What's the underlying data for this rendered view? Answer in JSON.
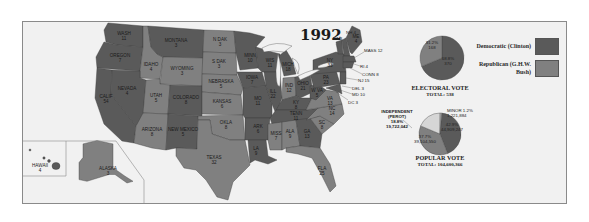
{
  "title": "1992",
  "colors": {
    "democratic": "#5a5a5a",
    "republican": "#808080",
    "independent": "#d6d6d6",
    "minor": "#b0b0b0",
    "water": "#f1f1f1",
    "border": "#3a3a3a"
  },
  "legend": [
    {
      "label": "Democratic (Clinton)",
      "party": "democratic"
    },
    {
      "label": "Republican (G.H.W. Bush)",
      "party": "republican"
    }
  ],
  "states": [
    {
      "abbr": "WASH",
      "ev": "11",
      "party": "democratic"
    },
    {
      "abbr": "OREGON",
      "ev": "7",
      "party": "democratic"
    },
    {
      "abbr": "CALIF",
      "ev": "54",
      "party": "democratic"
    },
    {
      "abbr": "IDAHO",
      "ev": "4",
      "party": "republican"
    },
    {
      "abbr": "NEVADA",
      "ev": "4",
      "party": "democratic"
    },
    {
      "abbr": "MONTANA",
      "ev": "3",
      "party": "democratic"
    },
    {
      "abbr": "WYOMING",
      "ev": "3",
      "party": "republican"
    },
    {
      "abbr": "UTAH",
      "ev": "5",
      "party": "republican"
    },
    {
      "abbr": "COLORADO",
      "ev": "8",
      "party": "democratic"
    },
    {
      "abbr": "ARIZONA",
      "ev": "8",
      "party": "republican"
    },
    {
      "abbr": "NEW MEXICO",
      "ev": "5",
      "party": "democratic"
    },
    {
      "abbr": "N DAK",
      "ev": "3",
      "party": "republican"
    },
    {
      "abbr": "S DAK",
      "ev": "3",
      "party": "republican"
    },
    {
      "abbr": "NEBRASKA",
      "ev": "5",
      "party": "republican"
    },
    {
      "abbr": "KANSAS",
      "ev": "6",
      "party": "republican"
    },
    {
      "abbr": "OKLA",
      "ev": "8",
      "party": "republican"
    },
    {
      "abbr": "TEXAS",
      "ev": "32",
      "party": "republican"
    },
    {
      "abbr": "MINN",
      "ev": "10",
      "party": "democratic"
    },
    {
      "abbr": "IOWA",
      "ev": "7",
      "party": "democratic"
    },
    {
      "abbr": "MO",
      "ev": "11",
      "party": "democratic"
    },
    {
      "abbr": "ARK",
      "ev": "6",
      "party": "democratic"
    },
    {
      "abbr": "LA",
      "ev": "9",
      "party": "democratic"
    },
    {
      "abbr": "WIS",
      "ev": "11",
      "party": "democratic"
    },
    {
      "abbr": "ILL",
      "ev": "22",
      "party": "democratic"
    },
    {
      "abbr": "MICH",
      "ev": "18",
      "party": "democratic"
    },
    {
      "abbr": "IND",
      "ev": "12",
      "party": "republican"
    },
    {
      "abbr": "OHIO",
      "ev": "21",
      "party": "democratic"
    },
    {
      "abbr": "KY",
      "ev": "8",
      "party": "democratic"
    },
    {
      "abbr": "TENN",
      "ev": "11",
      "party": "democratic"
    },
    {
      "abbr": "MISS",
      "ev": "7",
      "party": "republican"
    },
    {
      "abbr": "ALA",
      "ev": "9",
      "party": "republican"
    },
    {
      "abbr": "GA",
      "ev": "13",
      "party": "democratic"
    },
    {
      "abbr": "FLA",
      "ev": "25",
      "party": "republican"
    },
    {
      "abbr": "SC",
      "ev": "8",
      "party": "republican"
    },
    {
      "abbr": "NC",
      "ev": "14",
      "party": "republican"
    },
    {
      "abbr": "VA",
      "ev": "13",
      "party": "republican"
    },
    {
      "abbr": "W VA",
      "ev": "5",
      "party": "democratic"
    },
    {
      "abbr": "PA",
      "ev": "23",
      "party": "democratic"
    },
    {
      "abbr": "NY",
      "ev": "33",
      "party": "democratic"
    },
    {
      "abbr": "VT",
      "ev": "3",
      "party": "democratic"
    },
    {
      "abbr": "NH",
      "ev": "4",
      "party": "democratic"
    },
    {
      "abbr": "ME",
      "ev": "4",
      "party": "democratic"
    },
    {
      "abbr": "MASS",
      "ev": "12",
      "party": "democratic"
    },
    {
      "abbr": "RI",
      "ev": "4",
      "party": "democratic"
    },
    {
      "abbr": "CONN",
      "ev": "8",
      "party": "democratic"
    },
    {
      "abbr": "NJ",
      "ev": "15",
      "party": "democratic"
    },
    {
      "abbr": "DEL",
      "ev": "3",
      "party": "democratic"
    },
    {
      "abbr": "MD",
      "ev": "10",
      "party": "democratic"
    },
    {
      "abbr": "DC",
      "ev": "3",
      "party": "democratic"
    },
    {
      "abbr": "HAWAII",
      "ev": "4",
      "party": "democratic"
    },
    {
      "abbr": "ALASKA",
      "ev": "3",
      "party": "republican"
    }
  ],
  "callouts": {
    "vt": "VT 3",
    "nh": "NH 4",
    "mass": "MASS 12",
    "ri": "RI 4",
    "conn": "CONN 8",
    "nj": "NJ 15",
    "del": "DEL 3",
    "md": "MD 10",
    "dc": "DC 3"
  },
  "electoral_vote": {
    "caption": "ELECTORAL VOTE",
    "total_label": "TOTAL: 538",
    "slices": [
      {
        "party": "republican",
        "pct": "31.2%",
        "votes": "168"
      },
      {
        "party": "democratic",
        "pct": "68.8%",
        "votes": "370"
      }
    ]
  },
  "popular_vote": {
    "caption": "POPULAR VOTE",
    "total_label": "TOTAL: 104,600,366",
    "independent_label": "INDEPENDENT (PEROT)",
    "independent_pct": "18.8%",
    "independent_votes": "19,722,042",
    "minor_label": "MINOR 1.2%",
    "minor_votes": "1,221,884",
    "dem_pct": "42.9%",
    "dem_votes": "44,909,247",
    "rep_pct": "37.7%",
    "rep_votes": "39,104,550"
  },
  "chart_data": [
    {
      "type": "pie",
      "title": "ELECTORAL VOTE",
      "subtitle": "TOTAL: 538",
      "categories": [
        "Democratic (Clinton)",
        "Republican (G.H.W. Bush)"
      ],
      "values": [
        370,
        168
      ],
      "percent_labels": [
        "68.8%",
        "31.2%"
      ]
    },
    {
      "type": "pie",
      "title": "POPULAR VOTE",
      "subtitle": "TOTAL: 104,600,366",
      "categories": [
        "Democratic (Clinton)",
        "Republican (G.H.W. Bush)",
        "Independent (Perot)",
        "Minor"
      ],
      "values": [
        44909247,
        39104550,
        19722042,
        1221884
      ],
      "percent_labels": [
        "42.9%",
        "37.7%",
        "18.8%",
        "1.2%"
      ]
    }
  ]
}
